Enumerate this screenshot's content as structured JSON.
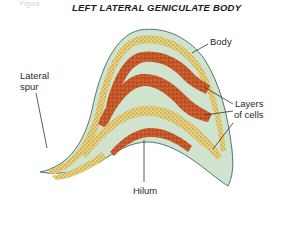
{
  "figure": {
    "fragment_text": "Figure",
    "title": "LEFT LATERAL GENICULATE BODY"
  },
  "labels": {
    "body": "Body",
    "lateral_spur_line1": "Lateral",
    "lateral_spur_line2": "spur",
    "layers_line1": "Layers",
    "layers_line2": "of cells",
    "hilum": "Hilum"
  },
  "colors": {
    "background": "#ffffff",
    "matrix": "#cfe3cf",
    "outline": "#4f7a72",
    "magnocellular_layer": "#e8d07a",
    "parvocellular_layer": "#c8582a",
    "stipple_dark": "#5a3a20",
    "leader_line": "#333333"
  }
}
